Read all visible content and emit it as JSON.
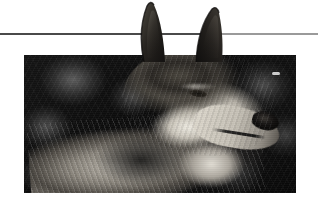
{
  "document": {
    "title": "Wolf portrait figure",
    "page_background": "#ffffff"
  },
  "divider": {
    "name": "horizontal-rule",
    "y": 33,
    "left_segment": {
      "x": 0,
      "width": 222,
      "color": "#4a4a4a",
      "thickness": 2
    },
    "right_segment": {
      "x": 222,
      "width": 96,
      "color": "#9a9a9a",
      "thickness": 2
    }
  },
  "figure": {
    "caption": "",
    "alt": "Black and white photograph of a wolf's head and shoulders in three-quarter profile, ears erect and breaking above the top edge of the photo frame, against a dark blurred forest background.",
    "frame": {
      "x": 24,
      "y": 55,
      "width": 272,
      "height": 138
    },
    "orientation": "three-quarter profile facing right",
    "palette": {
      "background_dark": "#0d0d0d",
      "background_mid": "#3a3a3a",
      "fur_light": "#e6e2d8",
      "fur_mid": "#8a857c",
      "fur_dark": "#2a2724",
      "nose_black": "#0a0908",
      "photo_border": "#0d0d0d"
    },
    "elements": [
      {
        "name": "left-ear",
        "description": "erect pointed ear breaking above photo frame"
      },
      {
        "name": "right-ear",
        "description": "erect pointed ear breaking above photo frame"
      },
      {
        "name": "eye",
        "description": "dark amber eye in left of head mass"
      },
      {
        "name": "muzzle",
        "description": "pale muzzle angled to the right"
      },
      {
        "name": "nose",
        "description": "black nose at the tip of the muzzle"
      },
      {
        "name": "neck-ruff",
        "description": "thick streaked fur of neck and chest"
      },
      {
        "name": "background-highlight",
        "description": "small bright bokeh speck at upper right"
      }
    ]
  }
}
